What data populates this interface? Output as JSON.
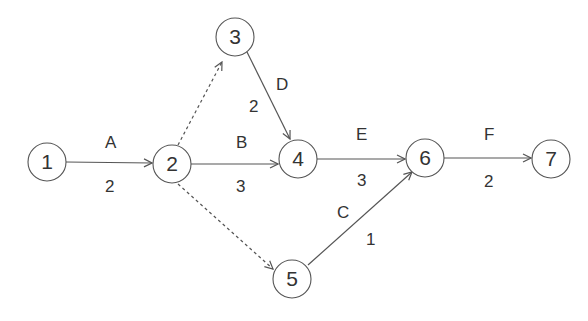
{
  "diagram": {
    "type": "activity-on-arrow network",
    "nodes": [
      {
        "id": "1",
        "label": "1",
        "x": 47,
        "y": 162
      },
      {
        "id": "2",
        "label": "2",
        "x": 172,
        "y": 164
      },
      {
        "id": "3",
        "label": "3",
        "x": 235,
        "y": 37
      },
      {
        "id": "4",
        "label": "4",
        "x": 298,
        "y": 159
      },
      {
        "id": "5",
        "label": "5",
        "x": 292,
        "y": 279
      },
      {
        "id": "6",
        "label": "6",
        "x": 425,
        "y": 158
      },
      {
        "id": "7",
        "label": "7",
        "x": 551,
        "y": 159
      }
    ],
    "edges": [
      {
        "from": "1",
        "to": "2",
        "activity": "A",
        "duration": "2",
        "style": "solid"
      },
      {
        "from": "2",
        "to": "4",
        "activity": "B",
        "duration": "3",
        "style": "solid"
      },
      {
        "from": "3",
        "to": "4",
        "activity": "D",
        "duration": "2",
        "style": "solid"
      },
      {
        "from": "4",
        "to": "6",
        "activity": "E",
        "duration": "3",
        "style": "solid"
      },
      {
        "from": "5",
        "to": "6",
        "activity": "C",
        "duration": "1",
        "style": "solid"
      },
      {
        "from": "6",
        "to": "7",
        "activity": "F",
        "duration": "2",
        "style": "solid"
      },
      {
        "from": "2",
        "to": "3",
        "activity": "",
        "duration": "",
        "style": "dashed"
      },
      {
        "from": "2",
        "to": "5",
        "activity": "",
        "duration": "",
        "style": "dashed"
      }
    ]
  }
}
